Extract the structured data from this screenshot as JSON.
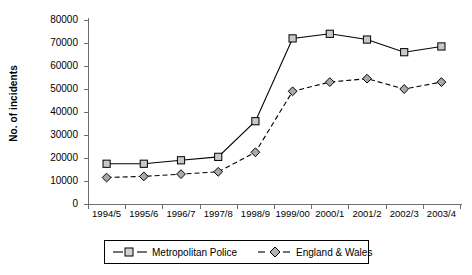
{
  "chart_data": {
    "type": "line",
    "title": "",
    "xlabel": "",
    "ylabel": "No. of incidents",
    "ylim": [
      0,
      80000
    ],
    "ytick_values": [
      80000,
      70000,
      60000,
      50000,
      40000,
      30000,
      20000,
      10000,
      0
    ],
    "ytick_labels": [
      "80000",
      "70000",
      "60000",
      "50000",
      "40000",
      "30000",
      "20000",
      "10000",
      "0"
    ],
    "grid": false,
    "legend_position": "bottom-center",
    "categories": [
      "1994/5",
      "1995/6",
      "1996/7",
      "1997/8",
      "1998/9",
      "1999/00",
      "2000/1",
      "2001/2",
      "2002/3",
      "2003/4"
    ],
    "series": [
      {
        "name": "Metropolitan Police",
        "marker": "open-square",
        "line_style": "solid",
        "color": "#000000",
        "marker_fill": "#c8c8c8",
        "values": [
          17500,
          17500,
          19000,
          20500,
          36000,
          72000,
          74000,
          71500,
          66000,
          68500
        ]
      },
      {
        "name": "England & Wales",
        "marker": "filled-diamond",
        "line_style": "dashed",
        "color": "#000000",
        "marker_fill": "#a8a8a8",
        "values": [
          11500,
          12000,
          13000,
          14000,
          22500,
          49000,
          53000,
          54500,
          50000,
          53000
        ]
      }
    ]
  },
  "legend": {
    "entries": [
      {
        "label": "Metropolitan Police"
      },
      {
        "label": "England & Wales"
      }
    ]
  }
}
